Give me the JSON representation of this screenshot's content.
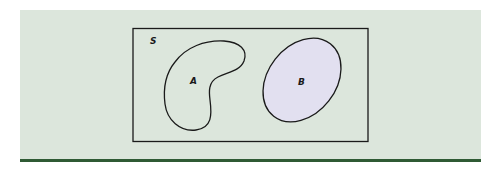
{
  "diagram": {
    "type": "venn",
    "background_color": "#dce6dc",
    "rule_color": "#2f5a34",
    "outline_color": "#1a1a1a",
    "universe": {
      "label": "S"
    },
    "sets": [
      {
        "label": "A",
        "shape": "kidney",
        "filled": false
      },
      {
        "label": "B",
        "shape": "ellipse",
        "filled": true,
        "fill_color": "#e2e0f0"
      }
    ],
    "relationship": "disjoint"
  }
}
